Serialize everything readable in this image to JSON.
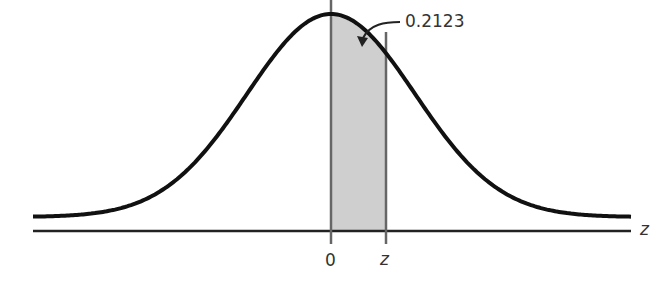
{
  "chart_data": {
    "type": "area",
    "title": "",
    "xlabel": "z",
    "ylabel": "",
    "tick_labels": [
      "0",
      "z"
    ],
    "annotation": "0.2123",
    "shaded_region": {
      "from": "0",
      "to": "z",
      "area": 0.2123
    },
    "grid": false,
    "legend": null
  },
  "labels": {
    "annotation": "0.2123",
    "tick_zero": "0",
    "tick_z": "z",
    "axis_label": "z"
  },
  "colors": {
    "curve": "#111111",
    "axis": "#222222",
    "shade": "#cfcfcf",
    "vertical_lines": "#666666"
  }
}
